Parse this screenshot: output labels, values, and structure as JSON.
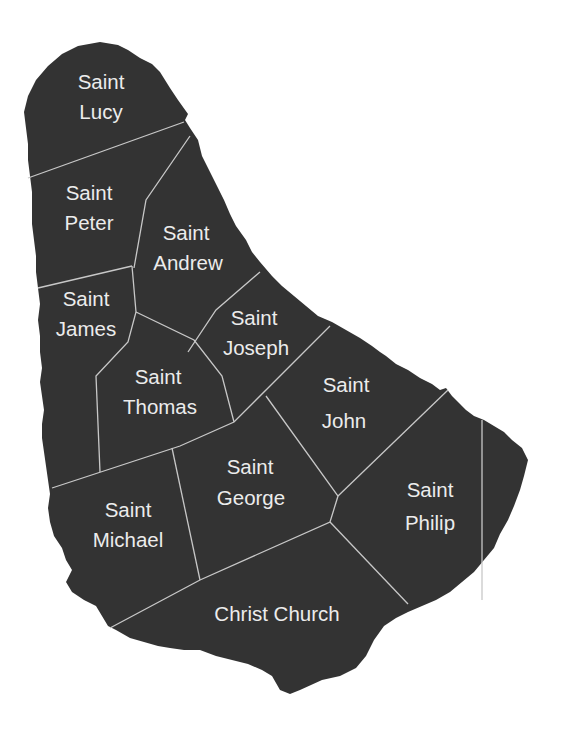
{
  "map": {
    "country": "Barbados",
    "background_color": "#ffffff",
    "land_color": "#333333",
    "border_color": "#c8c8c8",
    "label_color": "#ececec",
    "parishes": [
      {
        "id": "saint-lucy",
        "line1": "Saint",
        "line2": "Lucy"
      },
      {
        "id": "saint-peter",
        "line1": "Saint",
        "line2": "Peter"
      },
      {
        "id": "saint-andrew",
        "line1": "Saint",
        "line2": "Andrew"
      },
      {
        "id": "saint-james",
        "line1": "Saint",
        "line2": "James"
      },
      {
        "id": "saint-joseph",
        "line1": "Saint",
        "line2": "Joseph"
      },
      {
        "id": "saint-thomas",
        "line1": "Saint",
        "line2": "Thomas"
      },
      {
        "id": "saint-john",
        "line1": "Saint",
        "line2": "John"
      },
      {
        "id": "saint-george",
        "line1": "Saint",
        "line2": "George"
      },
      {
        "id": "saint-philip",
        "line1": "Saint",
        "line2": "Philip"
      },
      {
        "id": "saint-michael",
        "line1": "Saint",
        "line2": "Michael"
      },
      {
        "id": "christ-church",
        "line1": "Christ Church",
        "line2": ""
      }
    ]
  }
}
